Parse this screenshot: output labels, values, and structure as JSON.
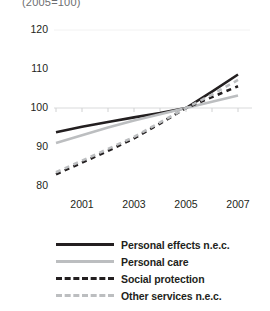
{
  "chart_data": {
    "type": "line",
    "title": "",
    "subtitle": "(2005=100)",
    "xlabel": "",
    "ylabel": "",
    "x": [
      2000,
      2001,
      2002,
      2003,
      2004,
      2005,
      2006,
      2007
    ],
    "xticks": [
      "2001",
      "2003",
      "2005",
      "2007"
    ],
    "xtick_values": [
      2001,
      2003,
      2005,
      2007
    ],
    "xlim": [
      2000,
      2007
    ],
    "yticks": [
      "80",
      "90",
      "100",
      "110",
      "120"
    ],
    "ytick_values": [
      80,
      90,
      100,
      110,
      120
    ],
    "ylim": [
      74,
      124
    ],
    "grid": false,
    "legend_position": "bottom",
    "series": [
      {
        "name": "Personal effects n.e.c.",
        "style": "solid",
        "color": "#231f20",
        "width": 2.6,
        "values": [
          93.8,
          95.2,
          96.4,
          97.6,
          98.7,
          100.0,
          104.2,
          108.6
        ]
      },
      {
        "name": "Personal care",
        "style": "solid",
        "color": "#bcbec0",
        "width": 2.6,
        "values": [
          91.0,
          93.0,
          95.0,
          96.8,
          98.4,
          100.0,
          101.6,
          103.2
        ]
      },
      {
        "name": "Social protection",
        "style": "dashed",
        "color": "#231f20",
        "width": 2.6,
        "values": [
          83.0,
          86.0,
          89.0,
          92.2,
          96.0,
          100.0,
          102.8,
          105.6
        ]
      },
      {
        "name": "Other services n.e.c.",
        "style": "dashed",
        "color": "#bcbec0",
        "width": 2.6,
        "values": [
          83.5,
          86.5,
          89.5,
          92.6,
          96.3,
          100.0,
          103.4,
          107.2
        ]
      }
    ]
  },
  "legend": {
    "items": [
      {
        "label": "Personal effects n.e.c.",
        "style": "solid",
        "color": "#231f20"
      },
      {
        "label": "Personal care",
        "style": "solid",
        "color": "#bcbec0"
      },
      {
        "label": "Social protection",
        "style": "dashed",
        "color": "#231f20"
      },
      {
        "label": "Other services n.e.c.",
        "style": "dashed",
        "color": "#bcbec0"
      }
    ]
  },
  "axis": {
    "y_labels": [
      "120",
      "110",
      "100",
      "90",
      "80"
    ],
    "x_labels": [
      "2001",
      "2003",
      "2005",
      "2007"
    ]
  }
}
